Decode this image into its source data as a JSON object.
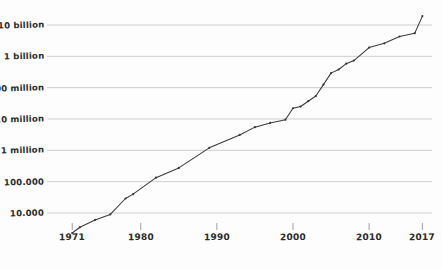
{
  "chart_data": {
    "type": "line",
    "title": "",
    "subtitle": "",
    "xlabel": "",
    "ylabel": "",
    "yscale": "log",
    "grid": true,
    "legend": null,
    "xlim": [
      1969,
      2018
    ],
    "ylim": [
      4000,
      25000000000
    ],
    "x_tick_labels": [
      "1971",
      "1980",
      "1990",
      "2000",
      "2010",
      "2017"
    ],
    "x_tick_values": [
      1971,
      1980,
      1990,
      2000,
      2010,
      2017
    ],
    "y_tick_labels": [
      "10.000",
      "100.000",
      "1 million",
      "10 million",
      "100 million",
      "1 billion",
      "10 billion"
    ],
    "y_tick_values": [
      10000,
      100000,
      1000000,
      10000000,
      100000000,
      1000000000,
      10000000000
    ],
    "series": [
      {
        "name": "",
        "x": [
          1971,
          1972,
          1974,
          1976,
          1978,
          1979,
          1982,
          1985,
          1989,
          1993,
          1995,
          1997,
          1999,
          2000,
          2001,
          2002,
          2003,
          2004,
          2005,
          2006,
          2007,
          2008,
          2010,
          2012,
          2014,
          2016,
          2017
        ],
        "y": [
          2300,
          3500,
          6000,
          9000,
          29000,
          40000,
          134000,
          275000,
          1200000,
          3100000,
          5500000,
          7500000,
          9500000,
          22000000,
          25000000,
          37000000,
          54000000,
          125000000,
          291000000,
          380000000,
          582000000,
          731000000,
          1900000000,
          2600000000,
          4300000000,
          5500000000,
          19200000000
        ]
      }
    ]
  },
  "axis": {
    "y_ticks": [
      {
        "label": "10 billion",
        "value": 10000000000
      },
      {
        "label": "1 billion",
        "value": 1000000000
      },
      {
        "label": "100 million",
        "value": 100000000
      },
      {
        "label": "10 million",
        "value": 10000000
      },
      {
        "label": "1 million",
        "value": 1000000
      },
      {
        "label": "100.000",
        "value": 100000
      },
      {
        "label": "10.000",
        "value": 10000
      }
    ],
    "x_ticks": [
      {
        "label": "1971",
        "value": 1971
      },
      {
        "label": "1980",
        "value": 1980
      },
      {
        "label": "1990",
        "value": 1990
      },
      {
        "label": "2000",
        "value": 2000
      },
      {
        "label": "2010",
        "value": 2010
      },
      {
        "label": "2017",
        "value": 2017
      }
    ]
  },
  "style": {
    "line_color": "#3a3a3a",
    "grid_color": "#c9c9c9",
    "background": "#fdfdfd",
    "text_color": "#2b2b2b"
  }
}
